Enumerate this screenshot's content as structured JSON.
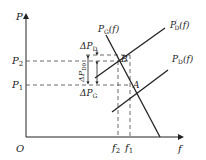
{
  "diagram": {
    "type": "power-frequency characteristic",
    "axes": {
      "y_label": "P",
      "x_label": "f",
      "origin_label": "O"
    },
    "levels": {
      "P2": {
        "base": "P",
        "sub": "2"
      },
      "P1": {
        "base": "P",
        "sub": "1"
      }
    },
    "frequencies": {
      "f2": {
        "base": "f",
        "sub": "2"
      },
      "f1": {
        "base": "f",
        "sub": "1"
      }
    },
    "curves": [
      {
        "id": "PG",
        "base": "P",
        "sub": "G",
        "arg": "(f)"
      },
      {
        "id": "PD_prime",
        "base": "P",
        "prime": "′",
        "sub": "D",
        "arg": "(f)"
      },
      {
        "id": "PD",
        "base": "P",
        "sub": "D",
        "arg": "(f)"
      }
    ],
    "points": {
      "A": "A",
      "B": "B"
    },
    "deltas": {
      "dPD": {
        "base": "ΔP",
        "sub": "D"
      },
      "dPD0": {
        "base": "ΔP",
        "sub": "D0"
      },
      "dPG": {
        "base": "ΔP",
        "sub": "G"
      }
    },
    "colors": {
      "line": "#222222",
      "dashed": "#444444",
      "background": "#ffffff"
    }
  }
}
